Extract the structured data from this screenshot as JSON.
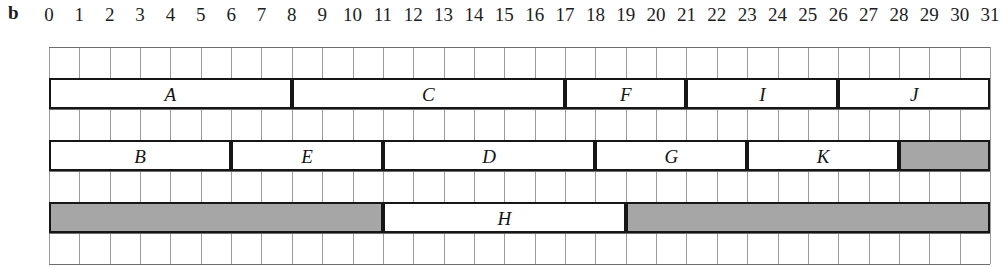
{
  "panel": {
    "label": "b"
  },
  "axis": {
    "min": 0,
    "max": 31,
    "ticks": [
      "0",
      "1",
      "2",
      "3",
      "4",
      "5",
      "6",
      "7",
      "8",
      "9",
      "10",
      "11",
      "12",
      "13",
      "14",
      "15",
      "16",
      "17",
      "18",
      "19",
      "20",
      "21",
      "22",
      "23",
      "24",
      "25",
      "26",
      "27",
      "28",
      "29",
      "30",
      "31"
    ]
  },
  "colors": {
    "bar_border": "#161616",
    "bar_fill": "#ffffff",
    "bar_shaded_fill": "#a6a6a6",
    "grid_minor": "#9a9a9a",
    "grid_major": "#6d6d6d",
    "text": "#141414",
    "background": "#ffffff"
  },
  "grid": {
    "rows": 7,
    "columns": 31
  },
  "chart_data": {
    "type": "bar",
    "title": "",
    "xlabel": "",
    "ylabel": "",
    "xlim": [
      0,
      31
    ],
    "grid": true,
    "legend": "none",
    "orientation": "horizontal",
    "note": "Gantt-style schedule: three machine rows of time intervals on a 0-31 unit axis; shaded blocks are idle/blocked intervals",
    "rows": [
      {
        "row": 1,
        "grid_row": 2,
        "tasks": [
          {
            "label": "A",
            "start": 0,
            "end": 8,
            "shaded": false
          },
          {
            "label": "C",
            "start": 8,
            "end": 17,
            "shaded": false
          },
          {
            "label": "F",
            "start": 17,
            "end": 21,
            "shaded": false
          },
          {
            "label": "I",
            "start": 21,
            "end": 26,
            "shaded": false
          },
          {
            "label": "J",
            "start": 26,
            "end": 31,
            "shaded": false
          }
        ]
      },
      {
        "row": 2,
        "grid_row": 4,
        "tasks": [
          {
            "label": "B",
            "start": 0,
            "end": 6,
            "shaded": false
          },
          {
            "label": "E",
            "start": 6,
            "end": 11,
            "shaded": false
          },
          {
            "label": "D",
            "start": 11,
            "end": 18,
            "shaded": false
          },
          {
            "label": "G",
            "start": 18,
            "end": 23,
            "shaded": false
          },
          {
            "label": "K",
            "start": 23,
            "end": 28,
            "shaded": false
          },
          {
            "label": "",
            "start": 28,
            "end": 31,
            "shaded": true
          }
        ]
      },
      {
        "row": 3,
        "grid_row": 6,
        "tasks": [
          {
            "label": "",
            "start": 0,
            "end": 11,
            "shaded": true
          },
          {
            "label": "H",
            "start": 11,
            "end": 19,
            "shaded": false
          },
          {
            "label": "",
            "start": 19,
            "end": 31,
            "shaded": true
          }
        ]
      }
    ]
  }
}
